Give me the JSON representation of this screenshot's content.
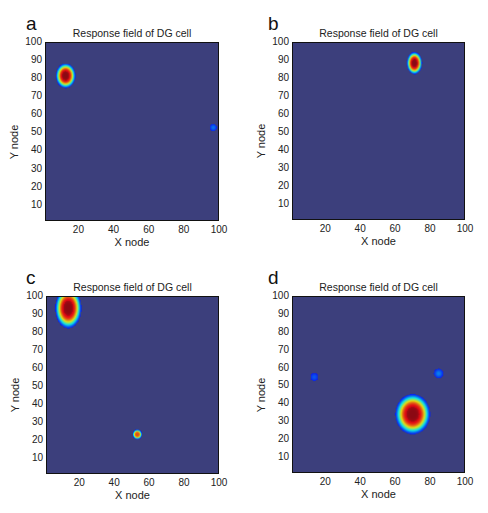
{
  "chart_data": [
    {
      "type": "heatmap",
      "panel": "a",
      "title": "Response field of DG cell",
      "xlabel": "X node",
      "ylabel": "Y node",
      "xlim": [
        1,
        100
      ],
      "ylim": [
        1,
        100
      ],
      "xticks": [
        20,
        40,
        60,
        80,
        100
      ],
      "yticks": [
        10,
        20,
        30,
        40,
        50,
        60,
        70,
        80,
        90,
        100
      ],
      "colormap": "jet",
      "background_value": 0.08,
      "fields": [
        {
          "x": 12,
          "y": 82,
          "rx": 4.5,
          "ry": 5.5,
          "peak": 1.0
        },
        {
          "x": 97,
          "y": 53,
          "rx": 2,
          "ry": 2,
          "peak": 0.2
        }
      ]
    },
    {
      "type": "heatmap",
      "panel": "b",
      "title": "Response field of DG cell",
      "xlabel": "X node",
      "ylabel": "Y node",
      "xlim": [
        1,
        100
      ],
      "ylim": [
        1,
        100
      ],
      "xticks": [
        20,
        40,
        60,
        80,
        100
      ],
      "yticks": [
        10,
        20,
        30,
        40,
        50,
        60,
        70,
        80,
        90,
        100
      ],
      "colormap": "jet",
      "background_value": 0.08,
      "fields": [
        {
          "x": 71,
          "y": 89,
          "rx": 3.5,
          "ry": 5,
          "peak": 1.0
        }
      ]
    },
    {
      "type": "heatmap",
      "panel": "c",
      "title": "Response field of DG cell",
      "xlabel": "X node",
      "ylabel": "Y node",
      "xlim": [
        1,
        100
      ],
      "ylim": [
        1,
        100
      ],
      "xticks": [
        20,
        40,
        60,
        80,
        100
      ],
      "yticks": [
        10,
        20,
        30,
        40,
        50,
        60,
        70,
        80,
        90,
        100
      ],
      "colormap": "jet",
      "background_value": 0.08,
      "fields": [
        {
          "x": 13,
          "y": 94,
          "rx": 6,
          "ry": 9,
          "peak": 1.0
        },
        {
          "x": 53,
          "y": 23,
          "rx": 2.2,
          "ry": 2.2,
          "peak": 0.85
        }
      ]
    },
    {
      "type": "heatmap",
      "panel": "d",
      "title": "Response field of DG cell",
      "xlabel": "X node",
      "ylabel": "Y node",
      "xlim": [
        1,
        100
      ],
      "ylim": [
        1,
        100
      ],
      "xticks": [
        20,
        40,
        60,
        80,
        100
      ],
      "yticks": [
        10,
        20,
        30,
        40,
        50,
        60,
        70,
        80,
        90,
        100
      ],
      "colormap": "jet",
      "background_value": 0.08,
      "fields": [
        {
          "x": 70,
          "y": 34,
          "rx": 8,
          "ry": 9,
          "peak": 1.0
        },
        {
          "x": 85,
          "y": 57,
          "rx": 2.5,
          "ry": 2.5,
          "peak": 0.22
        },
        {
          "x": 13,
          "y": 55,
          "rx": 2.5,
          "ry": 2.5,
          "peak": 0.16
        }
      ]
    }
  ],
  "panels": [
    {
      "letter": "a",
      "title": "Response field of DG cell",
      "xlabel": "X node",
      "ylabel": "Y node"
    },
    {
      "letter": "b",
      "title": "Response field of DG cell",
      "xlabel": "X node",
      "ylabel": "Y node"
    },
    {
      "letter": "c",
      "title": "Response field of DG cell",
      "xlabel": "X node",
      "ylabel": "Y node"
    },
    {
      "letter": "d",
      "title": "Response field of DG cell",
      "xlabel": "X node",
      "ylabel": "Y node"
    }
  ],
  "ticks": {
    "x": [
      "20",
      "40",
      "60",
      "80",
      "100"
    ],
    "y": [
      "100",
      "90",
      "80",
      "70",
      "60",
      "50",
      "40",
      "30",
      "20",
      "10"
    ]
  },
  "colors": {
    "background": "#3c3f7c",
    "axis": "#111111"
  }
}
